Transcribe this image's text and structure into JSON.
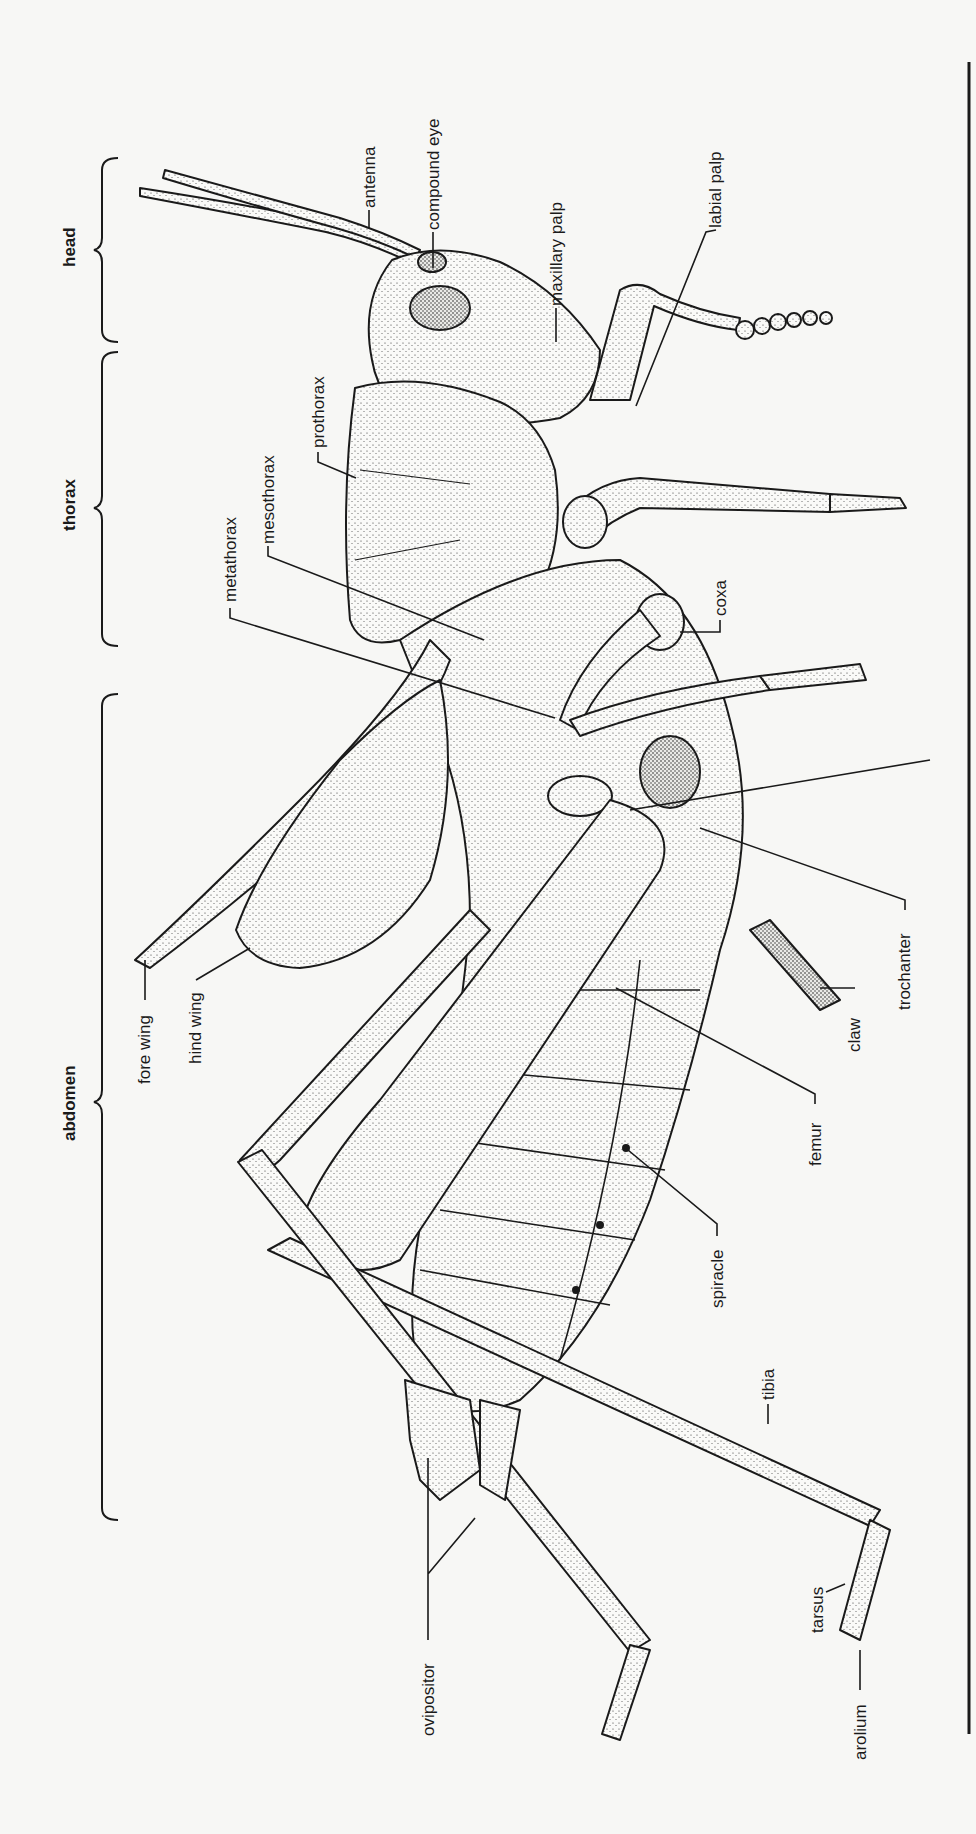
{
  "figure": {
    "orientation": "rotated counter-clockwise, head at top"
  },
  "regions": [
    {
      "id": "head",
      "label": "head"
    },
    {
      "id": "thorax",
      "label": "thorax"
    },
    {
      "id": "abdomen",
      "label": "abdomen"
    }
  ],
  "labels": {
    "antenna": "antenna",
    "compound_eye": "compound eye",
    "maxillary_palp": "maxillary palp",
    "labial_palp": "labial palp",
    "prothorax": "prothorax",
    "mesothorax": "mesothorax",
    "metathorax": "metathorax",
    "coxa": "coxa",
    "trochanter": "trochanter",
    "claw": "claw",
    "fore_wing": "fore wing",
    "hind_wing": "hind wing",
    "femur": "femur",
    "spiracle": "spiracle",
    "tibia": "tibia",
    "tarsus": "tarsus",
    "arolium": "arolium",
    "ovipositor": "ovipositor"
  },
  "colors": {
    "ink": "#1a1a1a",
    "paper": "#f7f7f5",
    "stipple": "#2a2a2a"
  }
}
